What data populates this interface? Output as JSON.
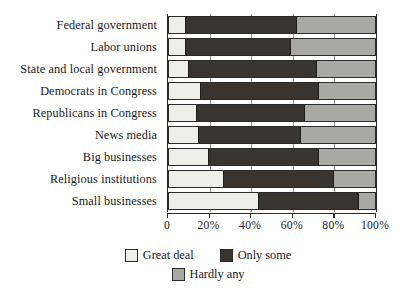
{
  "chart_data": {
    "type": "bar",
    "orientation": "horizontal",
    "stacked": true,
    "title": "",
    "subtitle": "",
    "xlabel": "",
    "ylabel": "",
    "xlim": [
      0,
      100
    ],
    "xticks": [
      0,
      20,
      40,
      60,
      80,
      100
    ],
    "xtick_labels": [
      "0",
      "20%",
      "40%",
      "60%",
      "80%",
      "100%"
    ],
    "grid": true,
    "legend_position": "bottom",
    "categories": [
      "Federal government",
      "Labor unions",
      "State and local government",
      "Democrats in Congress",
      "Republicans in Congress",
      "News media",
      "Big businesses",
      "Religious institutions",
      "Small businesses"
    ],
    "series": [
      {
        "name": "Great deal",
        "color": "#eeeeea",
        "values": [
          8,
          8,
          9,
          15,
          13,
          14,
          19,
          26,
          43
        ]
      },
      {
        "name": "Only some",
        "color": "#3a3430",
        "values": [
          54,
          51,
          63,
          58,
          53,
          50,
          54,
          54,
          49
        ]
      },
      {
        "name": "Hardly any",
        "color": "#a8a8a4",
        "values": [
          38,
          41,
          28,
          27,
          34,
          36,
          27,
          20,
          8
        ]
      }
    ],
    "cumulative_boundaries": [
      [
        8,
        62
      ],
      [
        8,
        59
      ],
      [
        9,
        72
      ],
      [
        15,
        73
      ],
      [
        13,
        66
      ],
      [
        14,
        64
      ],
      [
        19,
        73
      ],
      [
        26,
        80
      ],
      [
        43,
        92
      ]
    ]
  },
  "legend": {
    "items": [
      {
        "label": "Great deal",
        "swatch": "great"
      },
      {
        "label": "Only some",
        "swatch": "some"
      },
      {
        "label": "Hardly any",
        "swatch": "hardly"
      }
    ]
  }
}
